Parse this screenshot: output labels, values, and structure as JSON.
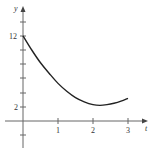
{
  "chart_data": {
    "type": "line",
    "title": "",
    "xlabel": "t",
    "ylabel": "y",
    "xlim": [
      0,
      3.5
    ],
    "ylim": [
      -2,
      16
    ],
    "x_ticks": [
      1,
      2,
      3
    ],
    "x_tick_labels": [
      "1",
      "2",
      "3"
    ],
    "y_ticks": [
      -2,
      2,
      4,
      6,
      8,
      10,
      12,
      14
    ],
    "y_tick_labels_shown": {
      "2": "2",
      "12": "12"
    },
    "grid": false,
    "legend": null,
    "series": [
      {
        "name": "y(t)",
        "x": [
          0,
          0.25,
          0.5,
          0.75,
          1.0,
          1.25,
          1.5,
          1.75,
          2.0,
          2.2,
          2.4,
          2.6,
          2.8,
          3.0
        ],
        "y": [
          12.0,
          10.0,
          8.2,
          6.7,
          5.3,
          4.2,
          3.3,
          2.7,
          2.3,
          2.2,
          2.3,
          2.5,
          2.8,
          3.2
        ]
      }
    ],
    "annotations": []
  },
  "labels": {
    "x_axis": "t",
    "y_axis": "y",
    "tick_x_1": "1",
    "tick_x_2": "2",
    "tick_x_3": "3",
    "tick_y_2": "2",
    "tick_y_12": "12"
  },
  "colors": {
    "axis": "#555555",
    "curve": "#222222"
  }
}
